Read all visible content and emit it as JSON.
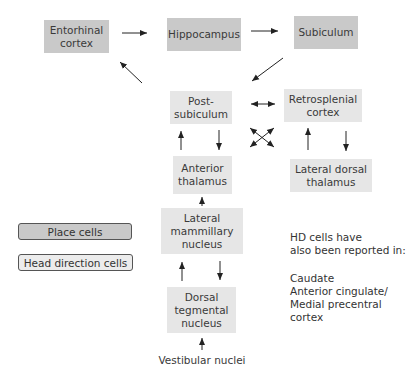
{
  "nodes": {
    "entorhinal": {
      "label": "Entorhinal\ncortex",
      "type": "place"
    },
    "hippocampus": {
      "label": "Hippocampus",
      "type": "place"
    },
    "subiculum": {
      "label": "Subiculum",
      "type": "place"
    },
    "postsubiculum": {
      "label": "Post-\nsubiculum",
      "type": "head-direction"
    },
    "retrosplenial": {
      "label": "Retrosplenial\ncortex",
      "type": "head-direction"
    },
    "anterior_thalamus": {
      "label": "Anterior\nthalamus",
      "type": "head-direction"
    },
    "lateral_dorsal_thalamus": {
      "label": "Lateral dorsal\nthalamus",
      "type": "head-direction"
    },
    "lateral_mammillary": {
      "label": "Lateral\nmammillary\nnucleus",
      "type": "head-direction"
    },
    "dorsal_tegmental": {
      "label": "Dorsal\ntegmental\nnucleus",
      "type": "head-direction"
    },
    "vestibular": {
      "label": "Vestibular nuclei",
      "type": "plain"
    }
  },
  "legend": {
    "place": "Place cells",
    "hd": "Head direction cells"
  },
  "note": {
    "heading": "HD cells have\nalso been reported in:",
    "items": "Caudate\nAnterior cingulate/\nMedial precentral cortex"
  },
  "colors": {
    "place_cells": "#c9c9c9",
    "head_direction_cells": "#e6e6e6",
    "arrow": "#222222"
  },
  "edges": [
    {
      "from": "entorhinal",
      "to": "hippocampus"
    },
    {
      "from": "hippocampus",
      "to": "subiculum"
    },
    {
      "from": "subiculum",
      "to": "postsubiculum"
    },
    {
      "from": "postsubiculum",
      "to": "entorhinal"
    },
    {
      "from": "postsubiculum",
      "to": "retrosplenial",
      "bidirectional": true
    },
    {
      "from": "postsubiculum",
      "to": "lateral_dorsal_thalamus",
      "bidirectional": true
    },
    {
      "from": "anterior_thalamus",
      "to": "retrosplenial",
      "bidirectional": true
    },
    {
      "from": "anterior_thalamus",
      "to": "postsubiculum"
    },
    {
      "from": "postsubiculum",
      "to": "anterior_thalamus"
    },
    {
      "from": "lateral_dorsal_thalamus",
      "to": "retrosplenial"
    },
    {
      "from": "retrosplenial",
      "to": "lateral_dorsal_thalamus"
    },
    {
      "from": "lateral_mammillary",
      "to": "anterior_thalamus"
    },
    {
      "from": "dorsal_tegmental",
      "to": "lateral_mammillary"
    },
    {
      "from": "lateral_mammillary",
      "to": "dorsal_tegmental"
    },
    {
      "from": "vestibular",
      "to": "dorsal_tegmental"
    }
  ]
}
